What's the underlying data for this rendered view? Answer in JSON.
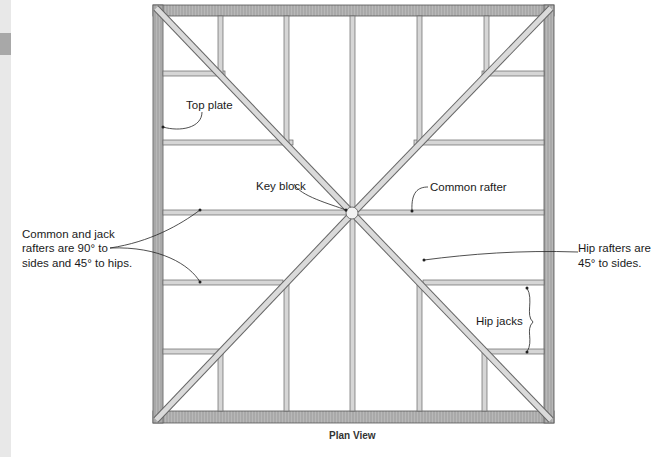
{
  "diagram": {
    "caption": "Plan View",
    "labels": {
      "top_plate": "Top plate",
      "key_block": "Key block",
      "common_rafter": "Common rafter",
      "common_jack_line1": "Common and jack",
      "common_jack_line2": "rafters are 90° to",
      "common_jack_line3": "sides and 45° to hips.",
      "hip_rafters_line1": "Hip rafters are",
      "hip_rafters_line2": "45° to sides.",
      "hip_jacks": "Hip jacks"
    },
    "colors": {
      "plate": "#a9a9a9",
      "member": "#d4d4d4",
      "outline": "#555555",
      "edge_strip": "#e8e8e8",
      "edge_tab": "#a8a8a8"
    }
  }
}
